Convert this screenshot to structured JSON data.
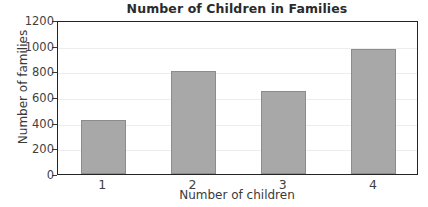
{
  "chart_data": {
    "type": "bar",
    "title": "Number of Children in Families",
    "xlabel": "Number of children",
    "ylabel": "Number of families",
    "categories": [
      "1",
      "2",
      "3",
      "4"
    ],
    "values": [
      420,
      800,
      650,
      975
    ],
    "ylim": [
      0,
      1200
    ],
    "yticks": [
      0,
      200,
      400,
      600,
      800,
      1000,
      1200
    ],
    "ytick_labels": [
      "0",
      "200",
      "400",
      "600",
      "800",
      "1000",
      "1200"
    ],
    "grid": true,
    "legend": null,
    "series": [
      {
        "name": "Number of families",
        "values": [
          420,
          800,
          650,
          975
        ]
      }
    ],
    "colors": {
      "bar_fill": "#a8a8a8",
      "bar_edge": "#8c8c8c",
      "grid": "#ededed",
      "frame": "#242424",
      "background": "#ffffff",
      "text": "#3a3a3a"
    }
  }
}
